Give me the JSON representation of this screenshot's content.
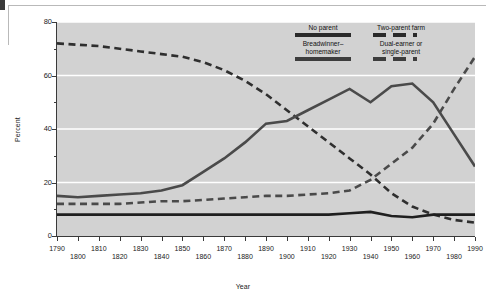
{
  "chart_data": {
    "type": "line",
    "title": "",
    "xlabel": "Year",
    "ylabel": "Percent",
    "xlim": [
      1790,
      1990
    ],
    "ylim": [
      0,
      80
    ],
    "grid": true,
    "legend_position": "top-right-inside",
    "x": [
      1790,
      1800,
      1810,
      1820,
      1830,
      1840,
      1850,
      1860,
      1870,
      1880,
      1890,
      1900,
      1910,
      1920,
      1930,
      1940,
      1950,
      1960,
      1970,
      1980,
      1990
    ],
    "xticks": [
      1790,
      1800,
      1810,
      1820,
      1830,
      1840,
      1850,
      1860,
      1870,
      1880,
      1890,
      1900,
      1910,
      1920,
      1930,
      1940,
      1950,
      1960,
      1970,
      1980,
      1990
    ],
    "xticklabels_top": [
      "1790",
      "1810",
      "1830",
      "1850",
      "1870",
      "1890",
      "1910",
      "1930",
      "1950",
      "1970",
      "1990"
    ],
    "xticklabels_bottom": [
      "1800",
      "1820",
      "1840",
      "1860",
      "1880",
      "1900",
      "1920",
      "1940",
      "1960",
      "1980"
    ],
    "yticks": [
      0,
      20,
      40,
      60,
      80
    ],
    "yticklabels": [
      "0",
      "20",
      "40",
      "60",
      "80"
    ],
    "series": [
      {
        "name": "Two-parent farm",
        "style": "dashed",
        "color": "#2f2f2f",
        "values": [
          72,
          71.5,
          71,
          70,
          69,
          68,
          67,
          65,
          62,
          58,
          53,
          47,
          41,
          35,
          29,
          23,
          16,
          11,
          8,
          6,
          5
        ]
      },
      {
        "name": "Breadwinner–homemaker",
        "style": "solid",
        "color": "#4a4a4a",
        "values": [
          15,
          14.5,
          15,
          15.5,
          16,
          17,
          19,
          24,
          29,
          35,
          42,
          43,
          47,
          51,
          55,
          50,
          56,
          57,
          50,
          38,
          26
        ]
      },
      {
        "name": "Dual-earner or single-parent",
        "style": "dashed",
        "color": "#4a4a4a",
        "values": [
          12,
          12,
          12,
          12,
          12.5,
          13,
          13,
          13.5,
          14,
          14.5,
          15,
          15,
          15.5,
          16,
          17,
          21,
          27,
          33,
          42,
          55,
          67
        ]
      },
      {
        "name": "No parent",
        "style": "solid",
        "color": "#1f1f1f",
        "values": [
          8,
          8,
          8,
          8,
          8,
          8,
          8,
          8,
          8,
          8,
          8,
          8,
          8,
          8,
          8.5,
          9,
          7.5,
          7,
          8,
          8,
          8
        ]
      }
    ]
  },
  "legend": {
    "left_column": [
      {
        "label": "No parent",
        "swatch": "solid-dark"
      },
      {
        "label_line1": "Breadwinner–",
        "label_line2": "homemaker",
        "swatch": "solid-gray"
      }
    ],
    "right_column": [
      {
        "label": "Two-parent farm",
        "swatch": "dashed"
      },
      {
        "label_line1": "Dual-earner or",
        "label_line2": "single-parent",
        "swatch": "dashed-gray"
      }
    ]
  },
  "colors": {
    "plot_background": "#d2d2d2",
    "gridline": "#ffffff",
    "axis": "#3a3a3a",
    "page_background": "#ffffff"
  }
}
